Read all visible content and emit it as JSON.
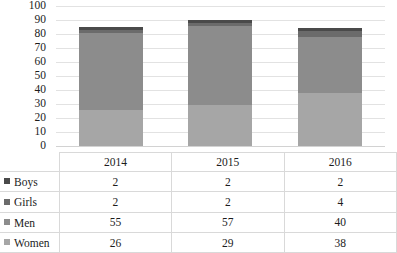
{
  "chart_data": {
    "type": "bar",
    "subtype": "stacked-column-with-data-table",
    "title": "",
    "xlabel": "",
    "ylabel": "",
    "categories": [
      "2014",
      "2015",
      "2016"
    ],
    "series": [
      {
        "name": "Women",
        "values": [
          26,
          29,
          38
        ],
        "color": "#a6a6a6",
        "legend_marker": "#a6a6a6"
      },
      {
        "name": "Men",
        "values": [
          55,
          57,
          40
        ],
        "color": "#8c8c8c",
        "legend_marker": "#8c8c8c"
      },
      {
        "name": "Girls",
        "values": [
          2,
          2,
          4
        ],
        "color": "#6b6b6b",
        "legend_marker": "#6b6b6b"
      },
      {
        "name": "Boys",
        "values": [
          2,
          2,
          2
        ],
        "color": "#4a4a4a",
        "legend_marker": "#4a4a4a"
      }
    ],
    "stack_order_bottom_to_top": [
      "Women",
      "Men",
      "Girls",
      "Boys"
    ],
    "totals": [
      85,
      90,
      84
    ],
    "ylim": [
      0,
      100
    ],
    "ytick_step": 10,
    "yticks": [
      "0",
      "10",
      "20",
      "30",
      "40",
      "50",
      "60",
      "70",
      "80",
      "90",
      "100"
    ],
    "grid": true,
    "legend_position": "data-table-row-labels"
  },
  "table": {
    "corner_label": "",
    "column_headers": [
      "2014",
      "2015",
      "2016"
    ],
    "rows": [
      {
        "label": "Boys",
        "marker": "#4a4a4a",
        "values": [
          "2",
          "2",
          "2"
        ]
      },
      {
        "label": "Girls",
        "marker": "#6b6b6b",
        "values": [
          "2",
          "2",
          "4"
        ]
      },
      {
        "label": "Men",
        "marker": "#8c8c8c",
        "values": [
          "55",
          "57",
          "40"
        ]
      },
      {
        "label": "Women",
        "marker": "#a6a6a6",
        "values": [
          "26",
          "29",
          "38"
        ]
      }
    ]
  },
  "colors": {
    "gridline": "#e2e2e2",
    "table_border": "#d9d9d9",
    "text": "#1c1c1c",
    "background": "#ffffff"
  }
}
